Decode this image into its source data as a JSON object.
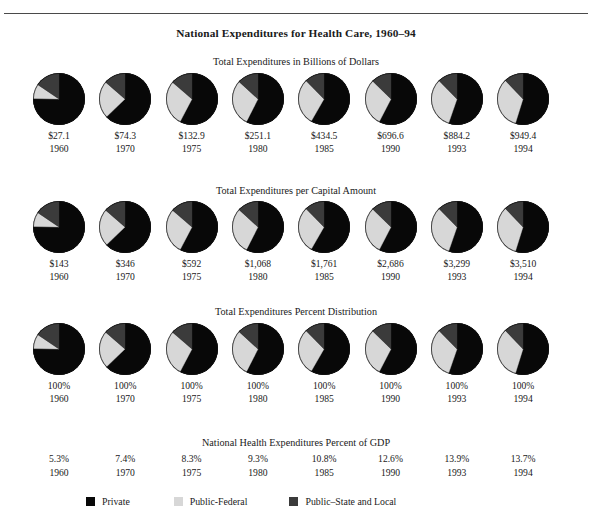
{
  "title": "National Expenditures for Health Care, 1960–94",
  "colors": {
    "private": "#080808",
    "public_federal": "#d7d7d7",
    "public_state_local": "#3b3b3b",
    "rule": "#4a4a4a",
    "text": "#1a1a1a"
  },
  "legend": {
    "items": [
      {
        "label": "Private",
        "color": "#080808",
        "swatch_name": "legend-swatch-private"
      },
      {
        "label": "Public-Federal",
        "color": "#d7d7d7",
        "swatch_name": "legend-swatch-public-federal"
      },
      {
        "label": "Public–State and Local",
        "color": "#3b3b3b",
        "swatch_name": "legend-swatch-public-state-local"
      }
    ]
  },
  "sections": {
    "billions": {
      "subtitle": "Total Expenditures in Billions of Dollars"
    },
    "per_capita": {
      "subtitle": "Total Expenditures per Capital Amount"
    },
    "percent": {
      "subtitle": "Total Expenditures Percent Distribution"
    },
    "gdp": {
      "subtitle": "National Health Expenditures Percent of GDP"
    }
  },
  "years": [
    "1960",
    "1970",
    "1975",
    "1980",
    "1985",
    "1990",
    "1993",
    "1994"
  ],
  "chart_data": {
    "type": "pie",
    "title": "National Expenditures for Health Care, 1960–94",
    "legend": [
      "Private",
      "Public-Federal",
      "Public–State and Local"
    ],
    "legend_position": "bottom",
    "series_colors": [
      "#080808",
      "#d7d7d7",
      "#3b3b3b"
    ],
    "categories": [
      "1960",
      "1970",
      "1975",
      "1980",
      "1985",
      "1990",
      "1993",
      "1994"
    ],
    "panels": [
      {
        "name": "Total Expenditures in Billions of Dollars",
        "ylabel": "Billions of Dollars",
        "labels": [
          "$27.1",
          "$74.3",
          "$132.9",
          "$251.1",
          "$434.5",
          "$696.6",
          "$884.2",
          "$949.4"
        ],
        "values": [
          27.1,
          74.3,
          132.9,
          251.1,
          434.5,
          696.6,
          884.2,
          949.4
        ],
        "slices": [
          {
            "year": "1960",
            "private": 75.3,
            "public_federal": 9.2,
            "public_state_local": 15.5
          },
          {
            "year": "1970",
            "private": 62.8,
            "public_federal": 23.6,
            "public_state_local": 13.6
          },
          {
            "year": "1975",
            "private": 57.7,
            "public_federal": 28.6,
            "public_state_local": 13.7
          },
          {
            "year": "1980",
            "private": 57.5,
            "public_federal": 29.3,
            "public_state_local": 13.2
          },
          {
            "year": "1985",
            "private": 58.3,
            "public_federal": 29.4,
            "public_state_local": 12.3
          },
          {
            "year": "1990",
            "private": 57.6,
            "public_federal": 29.7,
            "public_state_local": 12.7
          },
          {
            "year": "1993",
            "private": 55.3,
            "public_federal": 32.4,
            "public_state_local": 12.3
          },
          {
            "year": "1994",
            "private": 54.8,
            "public_federal": 33.1,
            "public_state_local": 12.1
          }
        ]
      },
      {
        "name": "Total Expenditures per Capital Amount",
        "ylabel": "Per Capita Amount",
        "labels": [
          "$143",
          "$346",
          "$592",
          "$1,068",
          "$1,761",
          "$2,686",
          "$3,299",
          "$3,510"
        ],
        "values": [
          143,
          346,
          592,
          1068,
          1761,
          2686,
          3299,
          3510
        ],
        "slices": [
          {
            "year": "1960",
            "private": 75.3,
            "public_federal": 9.2,
            "public_state_local": 15.5
          },
          {
            "year": "1970",
            "private": 62.8,
            "public_federal": 23.6,
            "public_state_local": 13.6
          },
          {
            "year": "1975",
            "private": 57.7,
            "public_federal": 28.6,
            "public_state_local": 13.7
          },
          {
            "year": "1980",
            "private": 57.5,
            "public_federal": 29.3,
            "public_state_local": 13.2
          },
          {
            "year": "1985",
            "private": 58.3,
            "public_federal": 29.4,
            "public_state_local": 12.3
          },
          {
            "year": "1990",
            "private": 57.6,
            "public_federal": 29.7,
            "public_state_local": 12.7
          },
          {
            "year": "1993",
            "private": 55.3,
            "public_federal": 32.4,
            "public_state_local": 12.3
          },
          {
            "year": "1994",
            "private": 54.8,
            "public_federal": 33.1,
            "public_state_local": 12.1
          }
        ]
      },
      {
        "name": "Total Expenditures Percent Distribution",
        "ylabel": "Percent Distribution",
        "labels": [
          "100%",
          "100%",
          "100%",
          "100%",
          "100%",
          "100%",
          "100%",
          "100%"
        ],
        "values": [
          100,
          100,
          100,
          100,
          100,
          100,
          100,
          100
        ],
        "slices": [
          {
            "year": "1960",
            "private": 75.3,
            "public_federal": 9.2,
            "public_state_local": 15.5
          },
          {
            "year": "1970",
            "private": 62.8,
            "public_federal": 23.6,
            "public_state_local": 13.6
          },
          {
            "year": "1975",
            "private": 57.7,
            "public_federal": 28.6,
            "public_state_local": 13.7
          },
          {
            "year": "1980",
            "private": 57.5,
            "public_federal": 29.3,
            "public_state_local": 13.2
          },
          {
            "year": "1985",
            "private": 58.3,
            "public_federal": 29.4,
            "public_state_local": 12.3
          },
          {
            "year": "1990",
            "private": 57.6,
            "public_federal": 29.7,
            "public_state_local": 12.7
          },
          {
            "year": "1993",
            "private": 55.3,
            "public_federal": 32.4,
            "public_state_local": 12.3
          },
          {
            "year": "1994",
            "private": 54.8,
            "public_federal": 33.1,
            "public_state_local": 12.1
          }
        ]
      }
    ],
    "gdp_panel": {
      "name": "National Health Expenditures Percent of GDP",
      "labels": [
        "5.3%",
        "7.4%",
        "8.3%",
        "9.3%",
        "10.8%",
        "12.6%",
        "13.9%",
        "13.7%"
      ],
      "values": [
        5.3,
        7.4,
        8.3,
        9.3,
        10.8,
        12.6,
        13.9,
        13.7
      ]
    }
  }
}
